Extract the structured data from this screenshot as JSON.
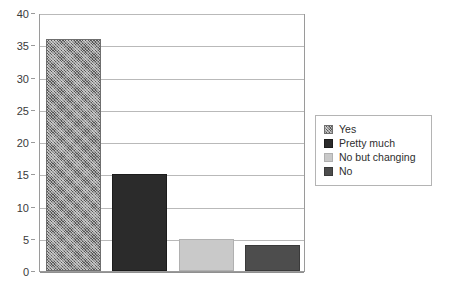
{
  "chart_data": {
    "type": "bar",
    "title": "",
    "subtitle": "",
    "xlabel": "",
    "ylabel": "",
    "categories": [
      "Yes",
      "Pretty much",
      "No but changing",
      "No"
    ],
    "values": [
      36,
      15,
      5,
      4
    ],
    "series": [
      {
        "name": "Responses",
        "values": [
          36,
          15,
          5,
          4
        ]
      }
    ],
    "ylim": [
      0,
      40
    ],
    "ytick_labels": [
      "0",
      "5",
      "10",
      "15",
      "20",
      "25",
      "30",
      "35",
      "40"
    ],
    "ytick_values": [
      0,
      5,
      10,
      15,
      20,
      25,
      30,
      35,
      40
    ],
    "xtick_labels": [],
    "grid": true,
    "grid_axis": "y",
    "legend_position": "right",
    "bars": [
      {
        "label": "Yes",
        "value": 36,
        "fill_class": "fill-hatch",
        "color": "#8e8e8e",
        "pattern": "crosshatch"
      },
      {
        "label": "Pretty much",
        "value": 15,
        "fill_class": "fill-dark",
        "color": "#2b2b2b",
        "pattern": "solid"
      },
      {
        "label": "No but changing",
        "value": 5,
        "fill_class": "fill-light",
        "color": "#c9c9c9",
        "pattern": "solid"
      },
      {
        "label": "No",
        "value": 4,
        "fill_class": "fill-medium",
        "color": "#4d4d4d",
        "pattern": "solid"
      }
    ]
  },
  "legend": {
    "entries": [
      {
        "label": "Yes",
        "fill_class": "fill-hatch"
      },
      {
        "label": "Pretty much",
        "fill_class": "fill-dark"
      },
      {
        "label": "No but changing",
        "fill_class": "fill-light"
      },
      {
        "label": "No",
        "fill_class": "fill-medium"
      }
    ]
  },
  "colors": {
    "background": "#ffffff",
    "axis": "#9a9a9a",
    "gridline": "#b9b9b9",
    "tick_text": "#3a3a3a",
    "legend_border": "#b4b4b4",
    "legend_text": "#2e2e2e"
  }
}
